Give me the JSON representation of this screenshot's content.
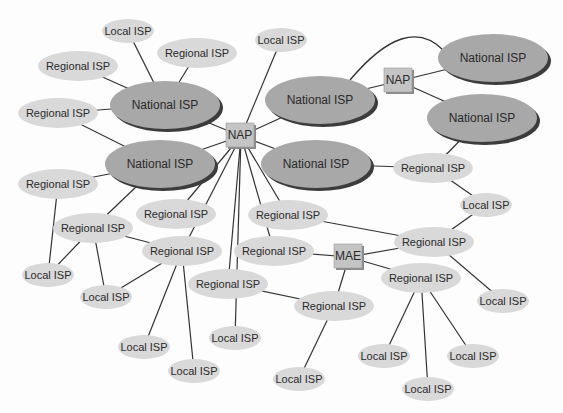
{
  "diagram": {
    "colors": {
      "national": "#a8a8a8",
      "national_shadow": "#3c3c3c",
      "regional": "#d9d9d9",
      "nap": "#c4c4c4",
      "nap_shadow": "#8a8a8a",
      "edge": "#333333"
    },
    "nodes": [
      {
        "id": "L1",
        "type": "local",
        "label": "Local ISP",
        "x": 128,
        "y": 31,
        "rx": 26,
        "ry": 12
      },
      {
        "id": "R1",
        "type": "regional",
        "label": "Regional ISP",
        "x": 197,
        "y": 53,
        "rx": 40,
        "ry": 15
      },
      {
        "id": "R2",
        "type": "regional",
        "label": "Regional ISP",
        "x": 78,
        "y": 66,
        "rx": 40,
        "ry": 15
      },
      {
        "id": "N1",
        "type": "national",
        "label": "National ISP",
        "x": 165,
        "y": 105,
        "rx": 55,
        "ry": 24
      },
      {
        "id": "R3",
        "type": "regional",
        "label": "Regional ISP",
        "x": 58,
        "y": 113,
        "rx": 40,
        "ry": 15
      },
      {
        "id": "L2",
        "type": "local",
        "label": "Local ISP",
        "x": 281,
        "y": 40,
        "rx": 26,
        "ry": 12
      },
      {
        "id": "NAP1",
        "type": "nap",
        "label": "NAP",
        "x": 241,
        "y": 136
      },
      {
        "id": "N2",
        "type": "national",
        "label": "National ISP",
        "x": 160,
        "y": 164,
        "rx": 55,
        "ry": 24
      },
      {
        "id": "R4",
        "type": "regional",
        "label": "Regional ISP",
        "x": 58,
        "y": 184,
        "rx": 40,
        "ry": 15
      },
      {
        "id": "N3",
        "type": "national",
        "label": "National ISP",
        "x": 320,
        "y": 100,
        "rx": 55,
        "ry": 24
      },
      {
        "id": "NAP2",
        "type": "nap",
        "label": "NAP",
        "x": 399,
        "y": 81
      },
      {
        "id": "N4",
        "type": "national",
        "label": "National ISP",
        "x": 493,
        "y": 58,
        "rx": 55,
        "ry": 24
      },
      {
        "id": "N5",
        "type": "national",
        "label": "National ISP",
        "x": 482,
        "y": 118,
        "rx": 55,
        "ry": 24
      },
      {
        "id": "N6",
        "type": "national",
        "label": "National ISP",
        "x": 316,
        "y": 164,
        "rx": 55,
        "ry": 24
      },
      {
        "id": "R5",
        "type": "regional",
        "label": "Regional ISP",
        "x": 433,
        "y": 168,
        "rx": 40,
        "ry": 15
      },
      {
        "id": "L3",
        "type": "local",
        "label": "Local ISP",
        "x": 486,
        "y": 205,
        "rx": 26,
        "ry": 12
      },
      {
        "id": "R6",
        "type": "regional",
        "label": "Regional ISP",
        "x": 93,
        "y": 228,
        "rx": 40,
        "ry": 15
      },
      {
        "id": "R7",
        "type": "regional",
        "label": "Regional ISP",
        "x": 176,
        "y": 214,
        "rx": 40,
        "ry": 15
      },
      {
        "id": "R8",
        "type": "regional",
        "label": "Regional ISP",
        "x": 288,
        "y": 215,
        "rx": 40,
        "ry": 15
      },
      {
        "id": "L4",
        "type": "local",
        "label": "Local ISP",
        "x": 48,
        "y": 275,
        "rx": 26,
        "ry": 12
      },
      {
        "id": "R9",
        "type": "regional",
        "label": "Regional ISP",
        "x": 182,
        "y": 251,
        "rx": 40,
        "ry": 15
      },
      {
        "id": "R10",
        "type": "regional",
        "label": "Regional ISP",
        "x": 274,
        "y": 251,
        "rx": 40,
        "ry": 15
      },
      {
        "id": "MAE",
        "type": "nap",
        "label": "MAE",
        "x": 349,
        "y": 257
      },
      {
        "id": "R11",
        "type": "regional",
        "label": "Regional ISP",
        "x": 434,
        "y": 242,
        "rx": 40,
        "ry": 15
      },
      {
        "id": "L5",
        "type": "local",
        "label": "Local ISP",
        "x": 106,
        "y": 297,
        "rx": 26,
        "ry": 12
      },
      {
        "id": "R12",
        "type": "regional",
        "label": "Regional ISP",
        "x": 228,
        "y": 284,
        "rx": 40,
        "ry": 15
      },
      {
        "id": "R13",
        "type": "regional",
        "label": "Regional ISP",
        "x": 334,
        "y": 306,
        "rx": 40,
        "ry": 15
      },
      {
        "id": "R14",
        "type": "regional",
        "label": "Regional ISP",
        "x": 421,
        "y": 278,
        "rx": 40,
        "ry": 15
      },
      {
        "id": "L6",
        "type": "local",
        "label": "Local ISP",
        "x": 503,
        "y": 301,
        "rx": 26,
        "ry": 12
      },
      {
        "id": "L7",
        "type": "local",
        "label": "Local ISP",
        "x": 235,
        "y": 338,
        "rx": 26,
        "ry": 12
      },
      {
        "id": "L8",
        "type": "local",
        "label": "Local ISP",
        "x": 144,
        "y": 347,
        "rx": 26,
        "ry": 12
      },
      {
        "id": "L9",
        "type": "local",
        "label": "Local ISP",
        "x": 194,
        "y": 371,
        "rx": 26,
        "ry": 12
      },
      {
        "id": "L10",
        "type": "local",
        "label": "Local ISP",
        "x": 384,
        "y": 356,
        "rx": 26,
        "ry": 12
      },
      {
        "id": "L11",
        "type": "local",
        "label": "Local ISP",
        "x": 473,
        "y": 356,
        "rx": 26,
        "ry": 12
      },
      {
        "id": "L12",
        "type": "local",
        "label": "Local ISP",
        "x": 299,
        "y": 379,
        "rx": 26,
        "ry": 12
      },
      {
        "id": "L13",
        "type": "local",
        "label": "Local ISP",
        "x": 428,
        "y": 389,
        "rx": 26,
        "ry": 12
      }
    ],
    "edges": [
      [
        "L1",
        "N1"
      ],
      [
        "R1",
        "N1"
      ],
      [
        "R2",
        "N1"
      ],
      [
        "R3",
        "N1"
      ],
      [
        "N1",
        "NAP1"
      ],
      [
        "L2",
        "NAP1"
      ],
      [
        "N3",
        "NAP1"
      ],
      [
        "N2",
        "NAP1"
      ],
      [
        "N6",
        "NAP1"
      ],
      [
        "R3",
        "N2"
      ],
      [
        "R4",
        "N2"
      ],
      [
        "N2",
        "R6"
      ],
      [
        "N3",
        "NAP2"
      ],
      [
        "NAP2",
        "N4"
      ],
      [
        "NAP2",
        "N5"
      ],
      [
        "N5",
        "R5"
      ],
      [
        "N6",
        "R5"
      ],
      [
        "R5",
        "L3"
      ],
      [
        "L3",
        "R11"
      ],
      [
        "NAP1",
        "R7"
      ],
      [
        "NAP1",
        "R9"
      ],
      [
        "NAP1",
        "R12"
      ],
      [
        "NAP1",
        "R10"
      ],
      [
        "NAP1",
        "R8"
      ],
      [
        "NAP1",
        "L7"
      ],
      [
        "R4",
        "L4"
      ],
      [
        "R6",
        "L4"
      ],
      [
        "R6",
        "L5"
      ],
      [
        "R6",
        "R9"
      ],
      [
        "R9",
        "L5"
      ],
      [
        "R9",
        "L8"
      ],
      [
        "R9",
        "L9"
      ],
      [
        "R8",
        "R11"
      ],
      [
        "R10",
        "MAE"
      ],
      [
        "MAE",
        "R11"
      ],
      [
        "MAE",
        "R14"
      ],
      [
        "MAE",
        "R13"
      ],
      [
        "R12",
        "R13"
      ],
      [
        "R11",
        "L6"
      ],
      [
        "R13",
        "L12"
      ],
      [
        "R14",
        "L10"
      ],
      [
        "R14",
        "L13"
      ],
      [
        "R14",
        "L11"
      ]
    ],
    "curved_edges": [
      {
        "from": "N3",
        "to": "N4",
        "label": "arc"
      }
    ]
  }
}
